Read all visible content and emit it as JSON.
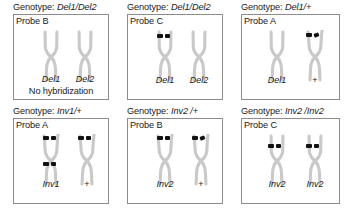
{
  "figure": {
    "panels": [
      {
        "id": "panel-del1-del2-probe-b",
        "genotype_prefix": "Genotype: ",
        "genotype_value": "Del1/Del2",
        "probe": "Probe B",
        "chromosomes": [
          {
            "label": "Del1",
            "label_italic": true,
            "signals": []
          },
          {
            "label": "Del2",
            "label_italic": true,
            "signals": []
          }
        ],
        "footnote": "No hybridization"
      },
      {
        "id": "panel-del1-del2-probe-c",
        "genotype_prefix": "Genotype: ",
        "genotype_value": "Del1/Del2",
        "probe": "Probe C",
        "chromosomes": [
          {
            "label": "Del1",
            "label_italic": true,
            "signals": [
              "top"
            ]
          },
          {
            "label": "Del2",
            "label_italic": true,
            "signals": []
          }
        ],
        "footnote": ""
      },
      {
        "id": "panel-del1-wt-probe-a",
        "genotype_prefix": "Genotype: ",
        "genotype_value": "Del1/+",
        "probe": "Probe A",
        "chromosomes": [
          {
            "label": "Del1",
            "label_italic": true,
            "signals": []
          },
          {
            "label": "+",
            "label_italic": false,
            "signals": [
              "top"
            ]
          }
        ],
        "footnote": ""
      },
      {
        "id": "panel-inv1-wt-probe-a",
        "genotype_prefix": "Genotype: ",
        "genotype_value": "Inv1/+",
        "probe": "Probe A",
        "chromosomes": [
          {
            "label": "Inv1",
            "label_italic": true,
            "signals": [
              "top",
              "lower"
            ]
          },
          {
            "label": "+",
            "label_italic": false,
            "signals": [
              "top"
            ]
          }
        ],
        "footnote": ""
      },
      {
        "id": "panel-inv2-wt-probe-b",
        "genotype_prefix": "Genotype: ",
        "genotype_value": "Inv2 /+",
        "probe": "Probe B",
        "chromosomes": [
          {
            "label": "Inv2",
            "label_italic": true,
            "signals": [
              "top"
            ]
          },
          {
            "label": "+",
            "label_italic": false,
            "signals": [
              "top"
            ]
          }
        ],
        "footnote": ""
      },
      {
        "id": "panel-inv2-inv2-probe-c",
        "genotype_prefix": "Genotype: ",
        "genotype_value": "Inv2 /Inv2",
        "probe": "Probe C",
        "chromosomes": [
          {
            "label": "Inv2",
            "label_italic": true,
            "signals": [
              "mid"
            ]
          },
          {
            "label": "Inv2",
            "label_italic": true,
            "signals": [
              "mid"
            ]
          }
        ],
        "footnote": ""
      }
    ],
    "colors": {
      "chromosome": "#c9c9c9",
      "signal": "#121212",
      "border": "#8c8c8c",
      "text": "#1a1a1a",
      "background": "#ffffff"
    }
  }
}
